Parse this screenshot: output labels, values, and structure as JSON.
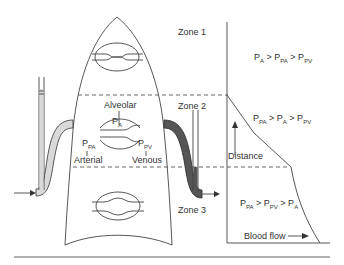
{
  "zones": [
    {
      "label": "Zone 1",
      "relation": {
        "parts": [
          [
            "P",
            "A"
          ],
          [
            " > P",
            "PA"
          ],
          [
            " > P",
            "PV"
          ]
        ]
      }
    },
    {
      "label": "Zone 2",
      "relation": {
        "parts": [
          [
            "P",
            "PA"
          ],
          [
            " > P",
            "A"
          ],
          [
            " > P",
            "PV"
          ]
        ]
      }
    },
    {
      "label": "Zone 3",
      "relation": {
        "parts": [
          [
            "P",
            "PA"
          ],
          [
            " > P",
            "PV"
          ],
          [
            " > P",
            "A"
          ]
        ]
      }
    }
  ],
  "lung": {
    "alveolar_label": "Alveolar",
    "pa_main": "P",
    "pa_sub": "A",
    "ppa_main": "P",
    "ppa_sub": "PA",
    "ppv_main": "P",
    "ppv_sub": "PV",
    "arterial_label": "Arterial",
    "venous_label": "Venous"
  },
  "graph": {
    "y_axis_label": "Distance",
    "x_axis_label": "Blood flow"
  },
  "colors": {
    "line": "#444444",
    "arterial_fill": "#d9d9d9",
    "venous_fill": "#555555"
  }
}
